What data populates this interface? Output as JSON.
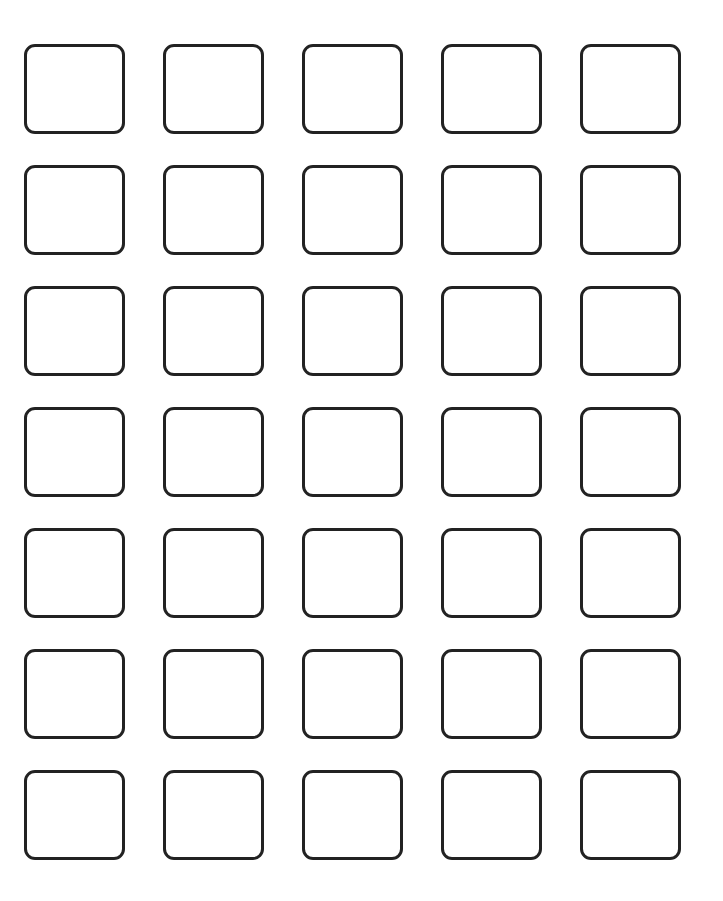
{
  "page": {
    "top_text_fragment": "",
    "grid": {
      "rows": 7,
      "columns": 5,
      "cells": [
        {
          "row": 1,
          "col": 1,
          "content": ""
        },
        {
          "row": 1,
          "col": 2,
          "content": ""
        },
        {
          "row": 1,
          "col": 3,
          "content": ""
        },
        {
          "row": 1,
          "col": 4,
          "content": ""
        },
        {
          "row": 1,
          "col": 5,
          "content": ""
        },
        {
          "row": 2,
          "col": 1,
          "content": ""
        },
        {
          "row": 2,
          "col": 2,
          "content": ""
        },
        {
          "row": 2,
          "col": 3,
          "content": ""
        },
        {
          "row": 2,
          "col": 4,
          "content": ""
        },
        {
          "row": 2,
          "col": 5,
          "content": ""
        },
        {
          "row": 3,
          "col": 1,
          "content": ""
        },
        {
          "row": 3,
          "col": 2,
          "content": ""
        },
        {
          "row": 3,
          "col": 3,
          "content": ""
        },
        {
          "row": 3,
          "col": 4,
          "content": ""
        },
        {
          "row": 3,
          "col": 5,
          "content": ""
        },
        {
          "row": 4,
          "col": 1,
          "content": ""
        },
        {
          "row": 4,
          "col": 2,
          "content": ""
        },
        {
          "row": 4,
          "col": 3,
          "content": ""
        },
        {
          "row": 4,
          "col": 4,
          "content": ""
        },
        {
          "row": 4,
          "col": 5,
          "content": ""
        },
        {
          "row": 5,
          "col": 1,
          "content": ""
        },
        {
          "row": 5,
          "col": 2,
          "content": ""
        },
        {
          "row": 5,
          "col": 3,
          "content": ""
        },
        {
          "row": 5,
          "col": 4,
          "content": ""
        },
        {
          "row": 5,
          "col": 5,
          "content": ""
        },
        {
          "row": 6,
          "col": 1,
          "content": ""
        },
        {
          "row": 6,
          "col": 2,
          "content": ""
        },
        {
          "row": 6,
          "col": 3,
          "content": ""
        },
        {
          "row": 6,
          "col": 4,
          "content": ""
        },
        {
          "row": 6,
          "col": 5,
          "content": ""
        },
        {
          "row": 7,
          "col": 1,
          "content": ""
        },
        {
          "row": 7,
          "col": 2,
          "content": ""
        },
        {
          "row": 7,
          "col": 3,
          "content": ""
        },
        {
          "row": 7,
          "col": 4,
          "content": ""
        },
        {
          "row": 7,
          "col": 5,
          "content": ""
        }
      ]
    },
    "colors": {
      "background": "#ffffff",
      "box_border": "#222222"
    }
  }
}
